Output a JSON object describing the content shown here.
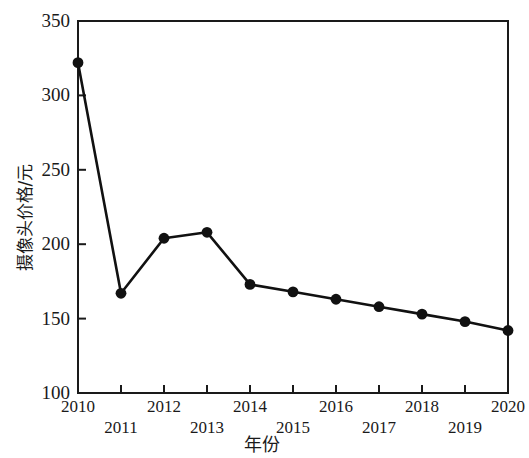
{
  "chart_data": {
    "type": "line",
    "title": "",
    "xlabel": "年份",
    "ylabel": "摄像头价格/元",
    "categories": [
      "2010",
      "2011",
      "2012",
      "2013",
      "2014",
      "2015",
      "2016",
      "2017",
      "2018",
      "2019",
      "2020"
    ],
    "values": [
      322,
      167,
      204,
      208,
      173,
      168,
      163,
      158,
      153,
      148,
      142
    ],
    "series": [
      {
        "name": "摄像头价格",
        "values": [
          322,
          167,
          204,
          208,
          173,
          168,
          163,
          158,
          153,
          148,
          142
        ]
      }
    ],
    "xlim": [
      2010,
      2020
    ],
    "ylim": [
      100,
      350
    ],
    "ytick_labels": [
      "350",
      "300",
      "250",
      "200",
      "150",
      "100"
    ],
    "ytick_values": [
      350,
      300,
      250,
      200,
      150,
      100
    ],
    "xtick_labels": [
      "2010",
      "2011",
      "2012",
      "2013",
      "2014",
      "2015",
      "2016",
      "2017",
      "2018",
      "2019",
      "2020"
    ],
    "grid": false,
    "legend": "none",
    "marker": "filled-circle",
    "line_color": "#111111",
    "marker_color": "#111111",
    "frame_color": "#1a1a1a",
    "background_color": "#ffffff"
  }
}
